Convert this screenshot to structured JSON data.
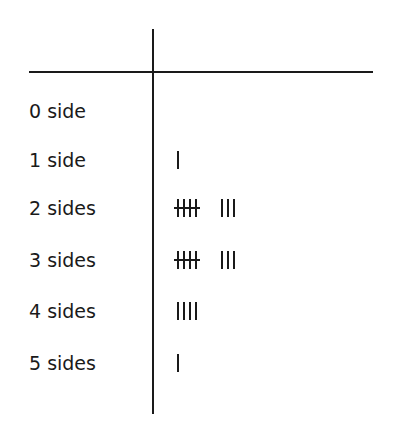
{
  "table": {
    "header": {
      "category": "",
      "tally": ""
    },
    "rows": [
      {
        "label": "0 side",
        "count": 0,
        "bundles": 0,
        "singles": 0,
        "top": 111
      },
      {
        "label": "1 side",
        "count": 1,
        "bundles": 0,
        "singles": 1,
        "top": 160
      },
      {
        "label": "2 sides",
        "count": 8,
        "bundles": 1,
        "singles": 3,
        "top": 208
      },
      {
        "label": "3 sides",
        "count": 8,
        "bundles": 1,
        "singles": 3,
        "top": 260
      },
      {
        "label": "4 sides",
        "count": 4,
        "bundles": 0,
        "singles": 4,
        "top": 311
      },
      {
        "label": "5 sides",
        "count": 1,
        "bundles": 0,
        "singles": 1,
        "top": 363
      }
    ]
  },
  "chart_data": {
    "type": "table",
    "title": "",
    "columns": [
      "Number of sides",
      "Tally"
    ],
    "categories": [
      "0 side",
      "1 side",
      "2 sides",
      "3 sides",
      "4 sides",
      "5 sides"
    ],
    "values": [
      0,
      1,
      8,
      8,
      4,
      1
    ],
    "tally_notation": "groups of five drawn as four vertical strokes with a horizontal strike",
    "grid": false,
    "legend": null
  },
  "colors": {
    "ink": "#1a1a1a",
    "background": "#ffffff"
  }
}
